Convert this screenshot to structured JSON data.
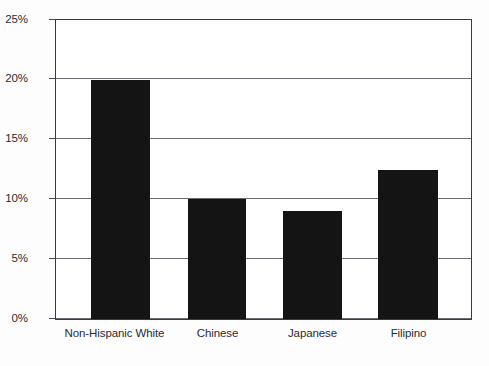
{
  "chart_data": {
    "type": "bar",
    "title": "",
    "subtitle": "",
    "xlabel": "",
    "ylabel": "",
    "categories": [
      "Non-Hispanic White",
      "Chinese",
      "Japanese",
      "Filipino"
    ],
    "values": [
      20,
      10,
      9,
      12.5
    ],
    "value_labels": [
      "20%",
      "10%",
      "9%",
      "12.5%"
    ],
    "ylim": [
      0,
      25
    ],
    "ytick_values": [
      0,
      5,
      10,
      15,
      20,
      25
    ],
    "ytick_labels": [
      "0%",
      "5%",
      "10%",
      "15%",
      "20%",
      "25%"
    ],
    "grid": true,
    "grid_axis": "y",
    "legend": false,
    "legend_position": "none",
    "series": [
      {
        "name": "",
        "values": [
          20,
          10,
          9,
          12.5
        ]
      }
    ],
    "colors": {
      "bar": "#141414",
      "gridline": "#6b6b73",
      "frame": "#3a3a42",
      "plot_background": "#ffffff",
      "figure_background": "#fdfdfd",
      "tick_label": "#2b2b31"
    }
  }
}
